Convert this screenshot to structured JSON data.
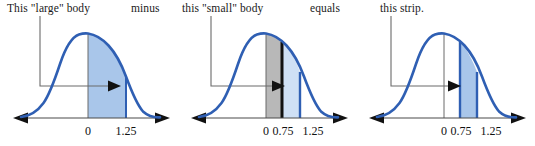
{
  "figure": {
    "colors": {
      "curve_blue": "#2f5fb3",
      "fill_blue": "#a9c6ea",
      "fill_light_blue": "#cfe0f5",
      "fill_gray": "#b8b8b8",
      "divider_black": "#111111",
      "axis_gray": "#555555",
      "leader_gray": "#6b6b6b"
    }
  },
  "connectors": [
    {
      "id": "minus",
      "label": "minus"
    },
    {
      "id": "equals",
      "label": "equals"
    }
  ],
  "panels": [
    {
      "id": "large-body",
      "caption": "This \"large\" body",
      "shaded_region": {
        "kind": "body",
        "from": 0,
        "to": 1.25,
        "fill": "blue"
      },
      "axis_ticks": [
        {
          "value": "0",
          "label": "0"
        },
        {
          "value": "1.25",
          "label": "1.25"
        }
      ]
    },
    {
      "id": "small-body",
      "caption": "this \"small\" body",
      "shaded_region": {
        "kind": "body",
        "from": 0,
        "to": 0.75,
        "fill": "gray"
      },
      "secondary_region": {
        "kind": "strip",
        "from": 0.75,
        "to": 1.25,
        "fill": "light-blue"
      },
      "axis_ticks": [
        {
          "value": "0",
          "label": "0"
        },
        {
          "value": "0.75",
          "label": "0.75"
        },
        {
          "value": "1.25",
          "label": "1.25"
        }
      ]
    },
    {
      "id": "strip",
      "caption": "this strip.",
      "shaded_region": {
        "kind": "strip",
        "from": 0.75,
        "to": 1.25,
        "fill": "blue"
      },
      "axis_ticks": [
        {
          "value": "0",
          "label": "0"
        },
        {
          "value": "0.75",
          "label": "0.75"
        },
        {
          "value": "1.25",
          "label": "1.25"
        }
      ]
    }
  ]
}
